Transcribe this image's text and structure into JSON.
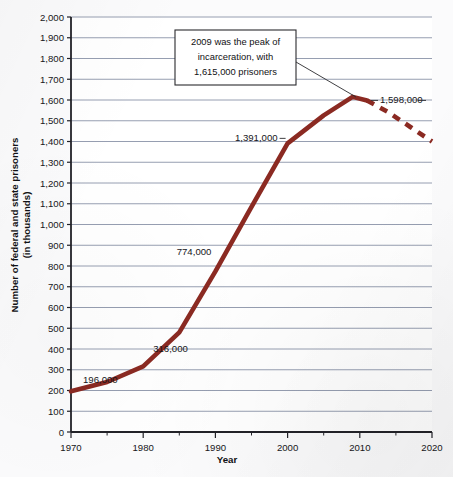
{
  "chart_data": {
    "type": "line",
    "title": "",
    "xlabel": "Year",
    "ylabel": "Number of federal and state prisoners (in thousands)",
    "xlim": [
      1970,
      2020
    ],
    "ylim": [
      0,
      2000
    ],
    "xticks": [
      1970,
      1980,
      1990,
      2000,
      2010,
      2020
    ],
    "xtick_labels": [
      "1970",
      "1980",
      "1990",
      "2000",
      "2010",
      "2020"
    ],
    "xminor_ticks": [
      1975,
      1985,
      1995,
      2005,
      2015
    ],
    "yticks": [
      0,
      100,
      200,
      300,
      400,
      500,
      600,
      700,
      800,
      900,
      1000,
      1100,
      1200,
      1300,
      1400,
      1500,
      1600,
      1700,
      1800,
      1900,
      2000
    ],
    "ytick_labels": [
      "0",
      "100",
      "200",
      "300",
      "400",
      "500",
      "600",
      "700",
      "800",
      "900",
      "1,000",
      "1,100",
      "1,200",
      "1,300",
      "1,400",
      "1,500",
      "1,600",
      "1,700",
      "1,800",
      "1,900",
      "2,000"
    ],
    "grid": true,
    "legend": "none",
    "line_color": "#8B2A22",
    "grid_color": "#8a93a8",
    "axis_color": "#222228",
    "series": [
      {
        "name": "Federal and state prisoners (in thousands)",
        "style": "solid",
        "x": [
          1970,
          1975,
          1980,
          1985,
          1990,
          1995,
          2000,
          2005,
          2009,
          2011
        ],
        "values": [
          196,
          241,
          316,
          480,
          774,
          1085,
          1391,
          1526,
          1615,
          1598
        ]
      },
      {
        "name": "Federal and state prisoners (projected / declining)",
        "style": "dashed",
        "x": [
          2011,
          2014,
          2017,
          2020
        ],
        "values": [
          1598,
          1540,
          1470,
          1400
        ]
      }
    ],
    "point_labels": [
      {
        "label": "196,000",
        "x": 1970,
        "value": 196
      },
      {
        "label": "316,000",
        "x": 1980,
        "value": 316
      },
      {
        "label": "774,000",
        "x": 1990,
        "value": 774
      },
      {
        "label": "1,391,000",
        "x": 2000,
        "value": 1391
      },
      {
        "label": "1,598,000",
        "x": 2011,
        "value": 1598
      }
    ],
    "annotations": [
      {
        "name": "peak-callout",
        "lines": [
          "2009 was the peak of",
          "incarceration, with",
          "1,615,000 prisoners"
        ],
        "points_to_x": 2009,
        "points_to_value": 1615
      }
    ]
  }
}
